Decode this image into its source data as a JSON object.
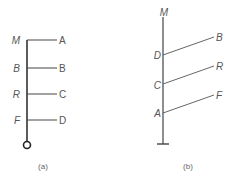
{
  "diagram_a": {
    "caption": "(a)",
    "left_labels": [
      "M",
      "B",
      "R",
      "F"
    ],
    "right_labels": [
      "A",
      "B",
      "C",
      "D"
    ]
  },
  "diagram_b": {
    "caption": "(b)",
    "top_label": "M",
    "left_labels": [
      "D",
      "C",
      "A"
    ],
    "right_labels": [
      "B",
      "R",
      "F"
    ]
  },
  "colors": {
    "line": "#444444",
    "text": "#555555"
  }
}
